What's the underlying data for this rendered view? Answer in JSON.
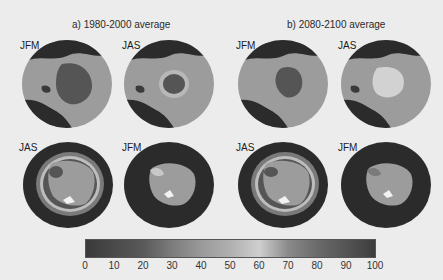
{
  "panels": {
    "a": {
      "title": "a) 1980-2000 average"
    },
    "b": {
      "title": "b) 2080-2100 average"
    }
  },
  "maps": [
    {
      "id": "a-arctic-jfm",
      "label": "JFM",
      "hemisphere": "north"
    },
    {
      "id": "a-arctic-jas",
      "label": "JAS",
      "hemisphere": "north"
    },
    {
      "id": "b-arctic-jfm",
      "label": "JFM",
      "hemisphere": "north"
    },
    {
      "id": "b-arctic-jas",
      "label": "JAS",
      "hemisphere": "north"
    },
    {
      "id": "a-antarctic-jas",
      "label": "JAS",
      "hemisphere": "south"
    },
    {
      "id": "a-antarctic-jfm",
      "label": "JFM",
      "hemisphere": "south"
    },
    {
      "id": "b-antarctic-jas",
      "label": "JAS",
      "hemisphere": "south"
    },
    {
      "id": "b-antarctic-jfm",
      "label": "JFM",
      "hemisphere": "south"
    }
  ],
  "colorbar": {
    "min": 0,
    "max": 100,
    "ticks": [
      "0",
      "10",
      "20",
      "30",
      "40",
      "50",
      "60",
      "70",
      "80",
      "90",
      "100"
    ]
  },
  "colors": {
    "ocean_dark": "#2b2b2b",
    "land": "#9c9c9c",
    "ice_core": "#555555",
    "ice_light": "#cfcfcf"
  }
}
